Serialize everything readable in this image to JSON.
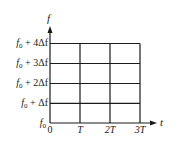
{
  "diagram": {
    "type": "time-frequency grid",
    "axes": {
      "x": {
        "label": "t",
        "ticks": [
          "0",
          "T",
          "2T",
          "3T"
        ]
      },
      "y": {
        "label": "f",
        "ticks": [
          "f0",
          "f0 + Δf",
          "f0 + 2Δf",
          "f0 + 3Δf",
          "f0 + 4Δf"
        ]
      }
    },
    "grid": {
      "columns": 3,
      "rows": 4
    },
    "colors": {
      "line": "#1a1a1a",
      "background": "#ffffff"
    }
  },
  "labels": {
    "x_axis": "t",
    "y_axis": "f",
    "x_ticks": [
      {
        "main": "0"
      },
      {
        "main": "T"
      },
      {
        "main": "2T"
      },
      {
        "main": "3T"
      }
    ],
    "y_ticks": [
      {
        "base": "f",
        "sub": "0",
        "rest": ""
      },
      {
        "base": "f",
        "sub": "0",
        "rest": " + Δf"
      },
      {
        "base": "f",
        "sub": "0",
        "rest": " + 2Δf"
      },
      {
        "base": "f",
        "sub": "0",
        "rest": " + 3Δf"
      },
      {
        "base": "f",
        "sub": "0",
        "rest": " + 4Δf"
      }
    ]
  }
}
